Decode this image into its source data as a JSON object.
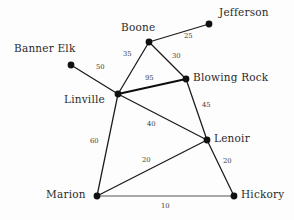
{
  "diagram": {
    "colors": {
      "background": "#fdfdfd",
      "node": "#111111",
      "edge": "#1a1a1a",
      "label_text": "#2b2b2b",
      "weight_text": "#3a3a3a"
    },
    "nodes": [
      {
        "id": "jefferson",
        "label": "Jefferson",
        "x": 209,
        "y": 24,
        "label_x": 219,
        "label_y": 7,
        "anchor": "start"
      },
      {
        "id": "boone",
        "label": "Boone",
        "x": 149,
        "y": 42,
        "label_x": 121,
        "label_y": 22,
        "anchor": "start"
      },
      {
        "id": "banner-elk",
        "label": "Banner Elk",
        "x": 71,
        "y": 65,
        "label_x": 14,
        "label_y": 43,
        "anchor": "start"
      },
      {
        "id": "blowing-rock",
        "label": "Blowing Rock",
        "x": 186,
        "y": 79,
        "label_x": 193,
        "label_y": 72,
        "anchor": "start"
      },
      {
        "id": "linville",
        "label": "Linville",
        "x": 118,
        "y": 94,
        "label_x": 64,
        "label_y": 94,
        "anchor": "start"
      },
      {
        "id": "lenoir",
        "label": "Lenoir",
        "x": 207,
        "y": 140,
        "label_x": 214,
        "label_y": 133,
        "anchor": "start"
      },
      {
        "id": "marion",
        "label": "Marion",
        "x": 97,
        "y": 196,
        "label_x": 46,
        "label_y": 189,
        "anchor": "start"
      },
      {
        "id": "hickory",
        "label": "Hickory",
        "x": 234,
        "y": 196,
        "label_x": 241,
        "label_y": 189,
        "anchor": "start"
      }
    ],
    "edges": [
      {
        "id": "boone-jefferson",
        "from": "boone",
        "to": "jefferson",
        "weight": "25",
        "wx": 184,
        "wy": 33,
        "style": "normal"
      },
      {
        "id": "boone-linville",
        "from": "boone",
        "to": "linville",
        "weight": "35",
        "wx": 123,
        "wy": 51,
        "style": "normal"
      },
      {
        "id": "boone-blowing-rock",
        "from": "boone",
        "to": "blowing-rock",
        "weight": "30",
        "wx": 172,
        "wy": 53,
        "style": "normal"
      },
      {
        "id": "banner-elk-linville",
        "from": "banner-elk",
        "to": "linville",
        "weight": "50",
        "wx": 96,
        "wy": 64,
        "style": "normal"
      },
      {
        "id": "linville-blowing-rock",
        "from": "linville",
        "to": "blowing-rock",
        "weight": "95",
        "wx": 145,
        "wy": 75,
        "style": "thick"
      },
      {
        "id": "blowing-rock-lenoir",
        "from": "blowing-rock",
        "to": "lenoir",
        "weight": "45",
        "wx": 202,
        "wy": 102,
        "style": "normal"
      },
      {
        "id": "linville-lenoir",
        "from": "linville",
        "to": "lenoir",
        "weight": "40",
        "wx": 147,
        "wy": 121,
        "style": "normal"
      },
      {
        "id": "linville-marion",
        "from": "linville",
        "to": "marion",
        "weight": "60",
        "wx": 90,
        "wy": 138,
        "style": "normal"
      },
      {
        "id": "marion-lenoir",
        "from": "marion",
        "to": "lenoir",
        "weight": "20",
        "wx": 142,
        "wy": 157,
        "style": "normal"
      },
      {
        "id": "lenoir-hickory",
        "from": "lenoir",
        "to": "hickory",
        "weight": "20",
        "wx": 223,
        "wy": 158,
        "style": "normal"
      },
      {
        "id": "marion-hickory",
        "from": "marion",
        "to": "hickory",
        "weight": "10",
        "wx": 161,
        "wy": 203,
        "style": "thin"
      }
    ]
  }
}
